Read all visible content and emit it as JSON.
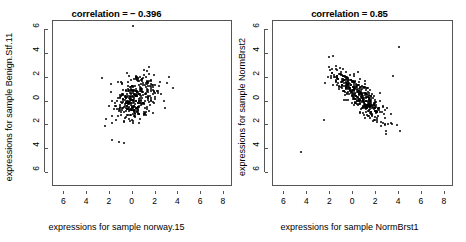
{
  "figure": {
    "type": "scatter-matrix-pair",
    "background": "#ffffff",
    "point_color": "#000000",
    "axis_color": "#555555"
  },
  "panels": [
    {
      "id": "left",
      "title": "correlation = − 0.396",
      "xlabel": "expressions for sample norway.15",
      "ylabel": "expressions for sample Benign.Stf.11",
      "x_ticks": [
        "8",
        "6",
        "4",
        "2",
        "0",
        "2",
        "4",
        "6"
      ],
      "y_ticks": [
        "6",
        "4",
        "2",
        "0",
        "2",
        "4",
        "6"
      ]
    },
    {
      "id": "right",
      "title": "correlation = 0.85",
      "xlabel": "expressions for sample NormBrst1",
      "ylabel": "expressions for sample NormBrst2",
      "x_ticks": [
        "8",
        "6",
        "4",
        "2",
        "0",
        "2",
        "4",
        "6"
      ],
      "y_ticks": [
        "6",
        "4",
        "2",
        "0",
        "2",
        "4",
        "6"
      ]
    }
  ],
  "chart_data": [
    {
      "type": "scatter",
      "panel": "left",
      "title": "correlation = − 0.396",
      "xlabel": "expressions for sample norway.15",
      "ylabel": "expressions for sample Benign.Stf.11",
      "correlation": -0.396,
      "xlim": [
        -8.8,
        7.0
      ],
      "ylim": [
        -7.2,
        6.8
      ],
      "x_axis_reversed": true,
      "y_axis_reversed": true,
      "xticks": [
        -8,
        -6,
        -4,
        -2,
        0,
        2,
        4,
        6
      ],
      "yticks": [
        6,
        4,
        2,
        0,
        -2,
        -4,
        -6
      ],
      "xtick_labels": [
        "8",
        "6",
        "4",
        "2",
        "0",
        "2",
        "4",
        "6"
      ],
      "ytick_labels": [
        "6",
        "4",
        "2",
        "0",
        "2",
        "4",
        "6"
      ],
      "grid": false,
      "legend": "none",
      "n_points": 360,
      "cluster": {
        "center_x": -0.35,
        "center_y": 0.25,
        "sd_x": 0.95,
        "sd_y": 1.05,
        "correlation": -0.396
      },
      "notable_points": [
        {
          "x": -0.1,
          "y": 6.3,
          "note": "high outlier near top"
        },
        {
          "x": 2.6,
          "y": 1.95,
          "note": "left isolated point"
        },
        {
          "x": -3.1,
          "y": 1.45,
          "note": "right isolated point"
        },
        {
          "x": -2.6,
          "y": 0.6,
          "note": "right point"
        },
        {
          "x": -2.9,
          "y": -0.6,
          "note": "lower right point"
        },
        {
          "x": 1.1,
          "y": -3.45,
          "note": "lower tail point"
        },
        {
          "x": 0.7,
          "y": -3.6,
          "note": "lower tail point"
        }
      ]
    },
    {
      "type": "scatter",
      "panel": "right",
      "title": "correlation = 0.85",
      "xlabel": "expressions for sample NormBrst1",
      "ylabel": "expressions for sample NormBrst2",
      "correlation": 0.85,
      "xlim": [
        -8.8,
        7.0
      ],
      "ylim": [
        -7.2,
        6.8
      ],
      "x_axis_reversed": true,
      "y_axis_reversed": true,
      "xticks": [
        -8,
        -6,
        -4,
        -2,
        0,
        2,
        4,
        6
      ],
      "yticks": [
        6,
        4,
        2,
        0,
        -2,
        -4,
        -6
      ],
      "xtick_labels": [
        "8",
        "6",
        "4",
        "2",
        "0",
        "2",
        "4",
        "6"
      ],
      "ytick_labels": [
        "6",
        "4",
        "2",
        "0",
        "2",
        "4",
        "6"
      ],
      "grid": false,
      "legend": "none",
      "n_points": 420,
      "cluster": {
        "center_x": -0.6,
        "center_y": 0.45,
        "sd_x": 1.25,
        "sd_y": 1.15,
        "correlation": 0.85
      },
      "notable_points": [
        {
          "x": -4.1,
          "y": 4.5,
          "note": "upper right extreme"
        },
        {
          "x": -3.6,
          "y": 2.1,
          "note": "upper right"
        },
        {
          "x": 1.6,
          "y": 2.2,
          "note": "left mid point"
        },
        {
          "x": 7.6,
          "y": -2.0,
          "note": "far left isolated outlier"
        },
        {
          "x": 4.5,
          "y": -4.35,
          "note": "low left outlier"
        },
        {
          "x": 2.5,
          "y": -1.6,
          "note": "left lower point"
        }
      ]
    }
  ]
}
